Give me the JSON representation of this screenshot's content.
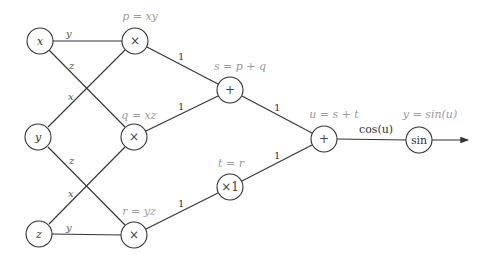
{
  "diagram": {
    "type": "computational-graph",
    "nodes": {
      "x": {
        "label": "x",
        "annotation": ""
      },
      "y_in": {
        "label": "y",
        "annotation": ""
      },
      "z": {
        "label": "z",
        "annotation": ""
      },
      "p": {
        "label": "×",
        "annotation": "p = xy"
      },
      "q": {
        "label": "×",
        "annotation": "q = xz"
      },
      "r": {
        "label": "×",
        "annotation": "r = yz"
      },
      "s": {
        "label": "+",
        "annotation": "s = p + q"
      },
      "t": {
        "label": "×1",
        "annotation": "t = r"
      },
      "u": {
        "label": "+",
        "annotation": "u = s + t"
      },
      "out": {
        "label": "sin",
        "annotation": "y = sin(u)"
      }
    },
    "edges": {
      "x_p": "y",
      "x_q": "z",
      "y_p": "x",
      "y_r": "z",
      "z_q": "x",
      "z_r": "y",
      "p_s": "1",
      "q_s": "1",
      "r_t": "1",
      "s_u": "1",
      "t_u": "1",
      "u_out": "cos(u)"
    },
    "colors": {
      "stroke": "#333333",
      "annotation": "#9a9a9a"
    }
  }
}
